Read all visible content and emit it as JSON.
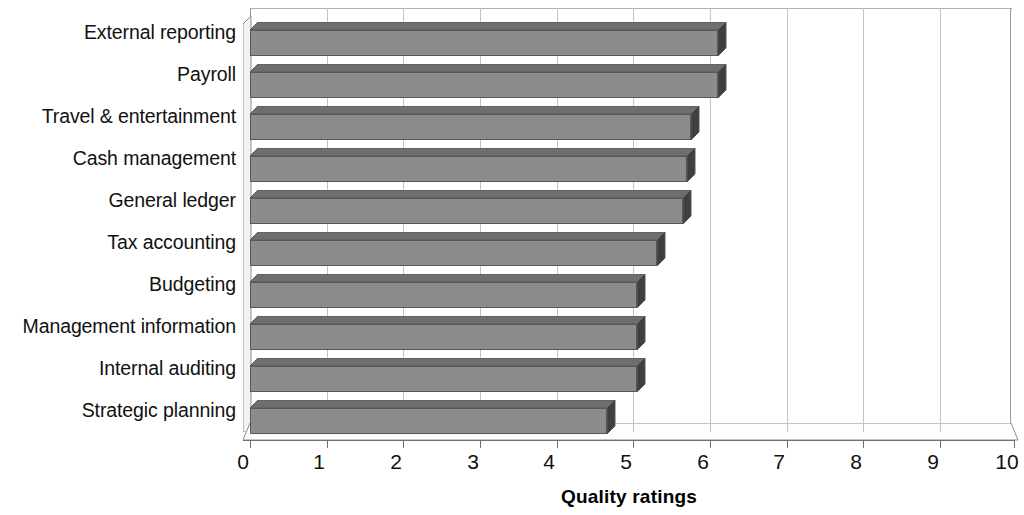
{
  "chart_data": {
    "type": "bar",
    "orientation": "horizontal",
    "style": "3d",
    "title": "",
    "xlabel": "Quality ratings",
    "ylabel": "",
    "xlim": [
      0,
      10
    ],
    "xticks": [
      "0",
      "1",
      "2",
      "3",
      "4",
      "5",
      "6",
      "7",
      "8",
      "9",
      "10"
    ],
    "grid": "vertical",
    "legend": "none",
    "categories": [
      "External reporting",
      "Payroll",
      "Travel & entertainment",
      "Cash management",
      "General ledger",
      "Tax accounting",
      "Budgeting",
      "Management information",
      "Internal auditing",
      "Strategic planning"
    ],
    "values": [
      6.1,
      6.1,
      5.75,
      5.7,
      5.65,
      5.3,
      5.05,
      5.05,
      5.05,
      4.65
    ],
    "series": [
      {
        "name": "Quality ratings",
        "values": [
          6.1,
          6.1,
          5.75,
          5.7,
          5.65,
          5.3,
          5.05,
          5.05,
          5.05,
          4.65
        ]
      }
    ],
    "colors": {
      "bar_face": "#8c8c8c",
      "bar_top": "#6e6e6e",
      "bar_side": "#3f3f3f",
      "bar_outline": "#585858",
      "gridline": "#c4c4c4",
      "axis": "#6f6f6f",
      "text": "#111111",
      "background": "#ffffff"
    }
  }
}
